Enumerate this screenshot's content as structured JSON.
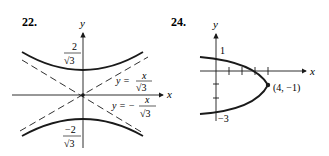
{
  "figures": [
    {
      "number": "22.",
      "axes": {
        "x": "x",
        "y": "y"
      },
      "curve": "hyperbola",
      "labels": {
        "upper_vertex_num": "2",
        "upper_vertex_den": "√3",
        "lower_vertex_num": "−2",
        "lower_vertex_den": "√3",
        "asym1_lhs": "y =",
        "asym1_num": "x",
        "asym1_den": "√3",
        "asym2_lhs": "y = −",
        "asym2_num": "x",
        "asym2_den": "√3"
      }
    },
    {
      "number": "24.",
      "axes": {
        "x": "x",
        "y": "y"
      },
      "curve": "parabola",
      "labels": {
        "y_tick_top": "1",
        "y_tick_bottom": "−3",
        "vertex": "(4, −1)"
      }
    }
  ]
}
